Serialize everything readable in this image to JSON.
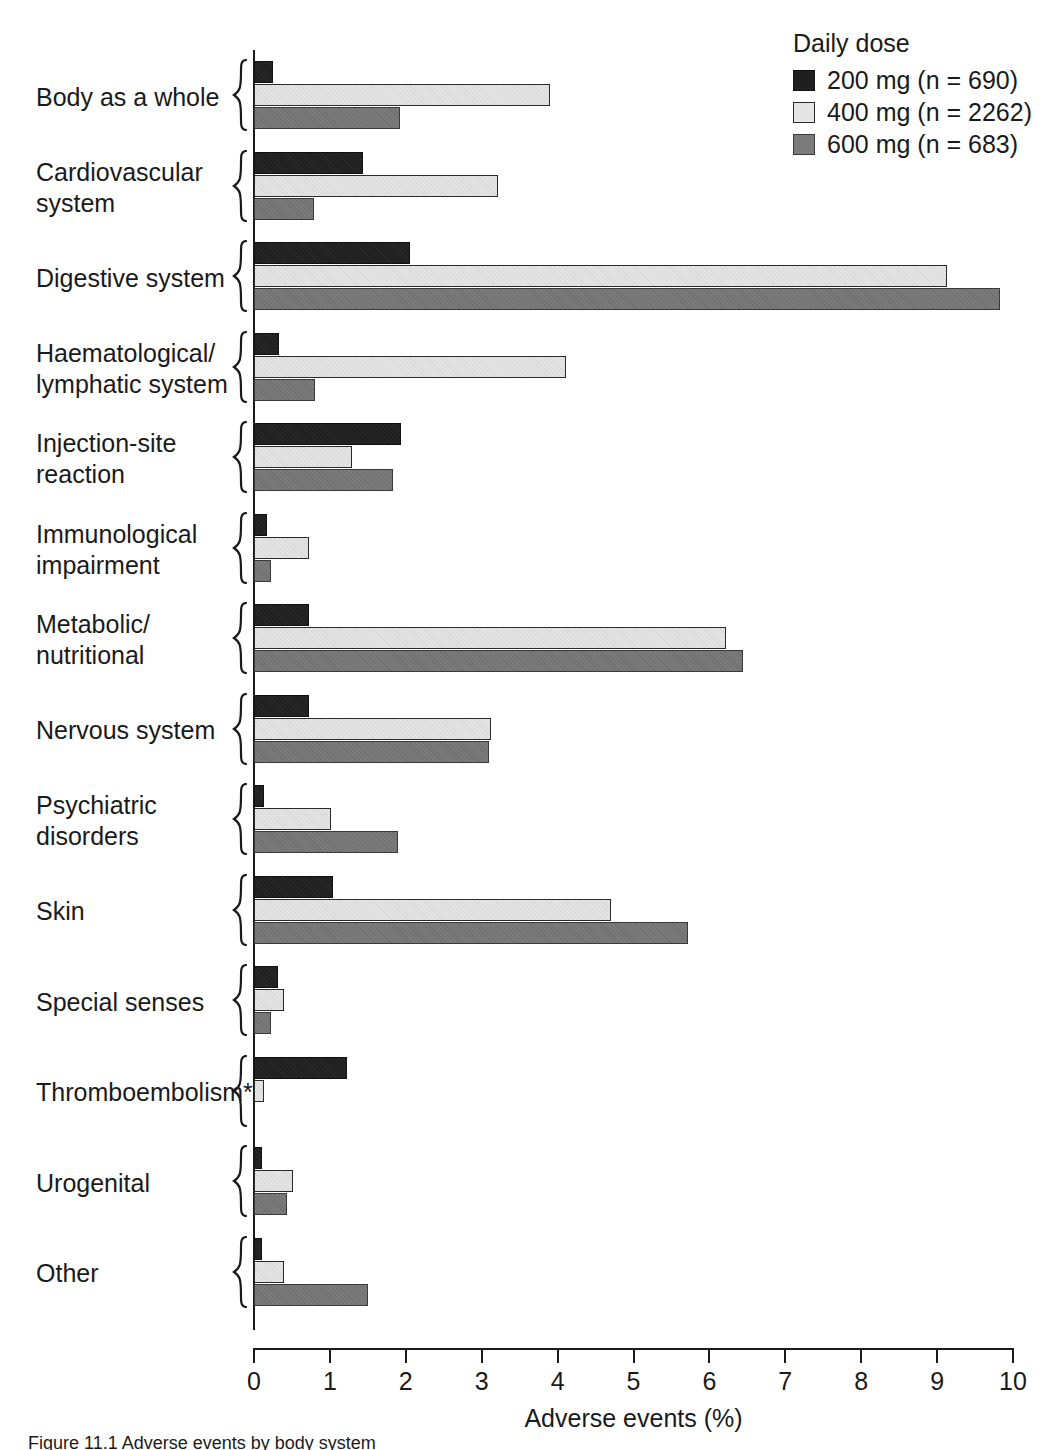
{
  "chart_data": {
    "type": "bar",
    "orientation": "horizontal",
    "title": "",
    "xlabel": "Adverse events (%)",
    "ylabel": "",
    "xlim": [
      0,
      10
    ],
    "xticks": [
      0,
      1,
      2,
      3,
      4,
      5,
      6,
      7,
      8,
      9,
      10
    ],
    "xtick_labels": [
      "0",
      "1",
      "2",
      "3",
      "4",
      "5",
      "6",
      "7",
      "8",
      "9",
      "10"
    ],
    "grid": false,
    "legend_position": "top-right",
    "legend_title": "Daily dose",
    "categories": [
      "Body as a whole",
      "Cardiovascular\nsystem",
      "Digestive system",
      "Haematological/\nlymphatic system",
      "Injection-site\nreaction",
      "Immunological\nimpairment",
      "Metabolic/\nnutritional",
      "Nervous system",
      "Psychiatric\ndisorders",
      "Skin",
      "Special senses",
      "Thromboembolism*",
      "Urogenital",
      "Other"
    ],
    "series": [
      {
        "name": "200 mg (n = 690)",
        "dose": "200 mg",
        "n": 690,
        "color": "#1f1f1f",
        "values": [
          0.25,
          1.44,
          2.05,
          0.33,
          1.94,
          0.17,
          0.73,
          0.72,
          0.13,
          1.04,
          0.32,
          1.22,
          0.11,
          0.1
        ]
      },
      {
        "name": "400 mg (n = 2262)",
        "dose": "400 mg",
        "n": 2262,
        "color": "#e4e4e4",
        "values": [
          3.9,
          3.21,
          9.13,
          4.11,
          1.29,
          0.72,
          6.22,
          3.12,
          1.01,
          4.7,
          0.4,
          0.13,
          0.51,
          0.4
        ]
      },
      {
        "name": "600 mg (n = 683)",
        "dose": "600 mg",
        "n": 683,
        "color": "#7b7b7b",
        "values": [
          1.92,
          0.79,
          9.83,
          0.8,
          1.83,
          0.22,
          6.44,
          3.1,
          1.9,
          5.72,
          0.22,
          0.0,
          0.43,
          1.5
        ]
      }
    ]
  },
  "legend": {
    "title": "Daily dose",
    "entries": [
      {
        "label": "200 mg (n = 690)",
        "swatch": "series-200mg-swatch"
      },
      {
        "label": "400 mg (n = 2262)",
        "swatch": "series-400mg-swatch"
      },
      {
        "label": "600 mg (n = 683)",
        "swatch": "series-600mg-swatch"
      }
    ]
  },
  "axis": {
    "x_title": "Adverse events (%)",
    "x_tick_labels": [
      "0",
      "1",
      "2",
      "3",
      "4",
      "5",
      "6",
      "7",
      "8",
      "9",
      "10"
    ]
  },
  "caption": {
    "text": "Figure 11.1  Adverse events by body system"
  }
}
